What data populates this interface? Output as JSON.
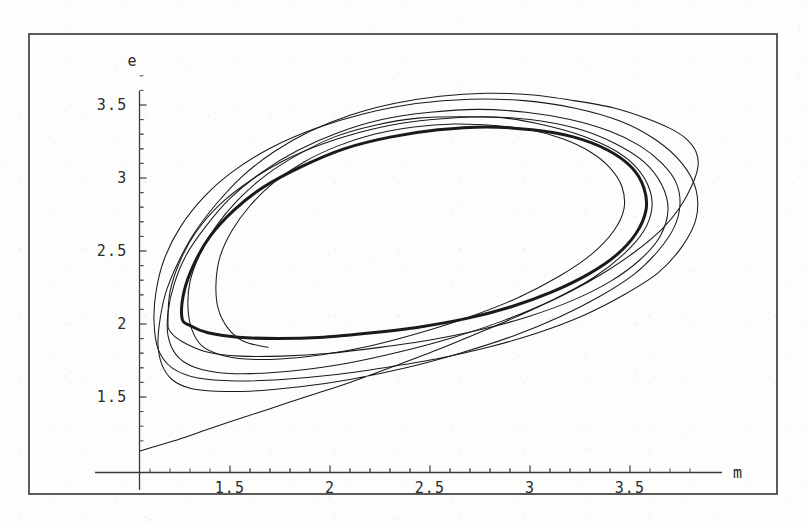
{
  "figure": {
    "background_color": "#fdfdfc",
    "frame_color": "#333333",
    "curve_color": "#1a1a1a",
    "axis_color": "#3a3a3a",
    "frame": {
      "x": 29,
      "y": 34,
      "width": 748,
      "height": 460
    }
  },
  "chart_data": {
    "type": "line",
    "title": "",
    "subtitle": "",
    "xlabel": "m",
    "ylabel": "e",
    "xlim": [
      1.045,
      3.88
    ],
    "ylim": [
      1.125,
      3.72
    ],
    "grid": false,
    "legend": "none",
    "axis_origin": {
      "x": 1.045,
      "y": 1.125
    },
    "x_ticks_major": [
      1.5,
      2,
      2.5,
      3,
      3.5
    ],
    "x_tick_labels": [
      "1.5",
      "2",
      "2.5",
      "3",
      "3.5"
    ],
    "x_minor_ticks_per_interval": 4,
    "y_ticks_major": [
      1.5,
      2,
      2.5,
      3,
      3.5
    ],
    "y_tick_labels": [
      "1.5",
      "2",
      "2.5",
      "3",
      "3.5"
    ],
    "y_minor_ticks_per_interval": 4,
    "series": [
      {
        "name": "transient-approach",
        "style": "thin",
        "points": [
          [
            1.05,
            1.13
          ],
          [
            1.12,
            1.16
          ],
          [
            1.22,
            1.2
          ],
          [
            1.35,
            1.26
          ],
          [
            1.5,
            1.33
          ],
          [
            1.7,
            1.42
          ],
          [
            1.9,
            1.51
          ],
          [
            2.1,
            1.6
          ],
          [
            2.32,
            1.71
          ],
          [
            2.55,
            1.83
          ],
          [
            2.78,
            1.96
          ],
          [
            3.0,
            2.09
          ],
          [
            3.2,
            2.22
          ],
          [
            3.38,
            2.36
          ],
          [
            3.53,
            2.5
          ],
          [
            3.66,
            2.65
          ],
          [
            3.75,
            2.8
          ],
          [
            3.81,
            2.95
          ],
          [
            3.84,
            3.08
          ],
          [
            3.83,
            3.18
          ],
          [
            3.78,
            3.27
          ],
          [
            3.7,
            3.34
          ],
          [
            3.58,
            3.41
          ],
          [
            3.42,
            3.48
          ],
          [
            3.22,
            3.53
          ],
          [
            3.0,
            3.57
          ],
          [
            2.78,
            3.58
          ],
          [
            2.55,
            3.56
          ],
          [
            2.32,
            3.51
          ],
          [
            2.1,
            3.43
          ],
          [
            1.9,
            3.32
          ],
          [
            1.72,
            3.18
          ],
          [
            1.56,
            3.01
          ],
          [
            1.43,
            2.82
          ],
          [
            1.32,
            2.62
          ],
          [
            1.24,
            2.42
          ],
          [
            1.18,
            2.22
          ],
          [
            1.15,
            2.03
          ],
          [
            1.14,
            1.86
          ],
          [
            1.16,
            1.72
          ],
          [
            1.21,
            1.62
          ],
          [
            1.3,
            1.56
          ],
          [
            1.43,
            1.54
          ],
          [
            1.6,
            1.54
          ],
          [
            1.85,
            1.57
          ],
          [
            2.1,
            1.62
          ],
          [
            2.38,
            1.7
          ],
          [
            2.65,
            1.8
          ],
          [
            2.92,
            1.92
          ],
          [
            3.15,
            2.05
          ],
          [
            3.35,
            2.19
          ],
          [
            3.52,
            2.34
          ],
          [
            3.64,
            2.5
          ],
          [
            3.72,
            2.66
          ],
          [
            3.75,
            2.82
          ],
          [
            3.73,
            2.97
          ],
          [
            3.66,
            3.1
          ],
          [
            3.55,
            3.22
          ],
          [
            3.4,
            3.32
          ],
          [
            3.2,
            3.4
          ],
          [
            2.98,
            3.45
          ],
          [
            2.74,
            3.47
          ],
          [
            2.5,
            3.45
          ],
          [
            2.26,
            3.4
          ],
          [
            2.04,
            3.31
          ],
          [
            1.84,
            3.19
          ],
          [
            1.66,
            3.04
          ],
          [
            1.5,
            2.86
          ],
          [
            1.38,
            2.67
          ],
          [
            1.28,
            2.47
          ],
          [
            1.22,
            2.27
          ],
          [
            1.19,
            2.08
          ],
          [
            1.19,
            1.92
          ],
          [
            1.23,
            1.79
          ],
          [
            1.31,
            1.71
          ],
          [
            1.43,
            1.67
          ],
          [
            1.6,
            1.66
          ],
          [
            1.82,
            1.68
          ],
          [
            2.08,
            1.73
          ],
          [
            2.35,
            1.81
          ],
          [
            2.62,
            1.91
          ],
          [
            2.88,
            2.03
          ],
          [
            3.12,
            2.17
          ],
          [
            3.32,
            2.32
          ],
          [
            3.47,
            2.48
          ],
          [
            3.57,
            2.64
          ],
          [
            3.61,
            2.8
          ],
          [
            3.59,
            2.95
          ],
          [
            3.52,
            3.09
          ],
          [
            3.41,
            3.2
          ],
          [
            3.26,
            3.29
          ],
          [
            3.08,
            3.36
          ],
          [
            2.88,
            3.41
          ],
          [
            2.66,
            3.42
          ],
          [
            2.44,
            3.41
          ],
          [
            2.22,
            3.36
          ],
          [
            2.02,
            3.28
          ],
          [
            1.84,
            3.16
          ],
          [
            1.68,
            3.02
          ],
          [
            1.54,
            2.85
          ],
          [
            1.43,
            2.67
          ],
          [
            1.35,
            2.48
          ],
          [
            1.3,
            2.29
          ],
          [
            1.29,
            2.11
          ],
          [
            1.31,
            1.96
          ],
          [
            1.36,
            1.85
          ],
          [
            1.45,
            1.79
          ],
          [
            1.58,
            1.76
          ],
          [
            1.75,
            1.76
          ],
          [
            1.96,
            1.79
          ],
          [
            2.2,
            1.85
          ],
          [
            2.45,
            1.94
          ],
          [
            2.7,
            2.05
          ],
          [
            2.94,
            2.18
          ],
          [
            3.15,
            2.33
          ],
          [
            3.31,
            2.48
          ],
          [
            3.42,
            2.64
          ],
          [
            3.47,
            2.79
          ],
          [
            3.46,
            2.94
          ],
          [
            3.4,
            3.07
          ],
          [
            3.3,
            3.18
          ],
          [
            3.16,
            3.27
          ],
          [
            3.0,
            3.33
          ],
          [
            2.82,
            3.36
          ],
          [
            2.62,
            3.37
          ],
          [
            2.42,
            3.35
          ],
          [
            2.22,
            3.3
          ],
          [
            2.04,
            3.22
          ],
          [
            1.87,
            3.11
          ],
          [
            1.72,
            2.97
          ],
          [
            1.6,
            2.81
          ],
          [
            1.51,
            2.64
          ],
          [
            1.45,
            2.46
          ],
          [
            1.43,
            2.28
          ],
          [
            1.44,
            2.11
          ],
          [
            1.49,
            1.97
          ],
          [
            1.57,
            1.88
          ],
          [
            1.69,
            1.84
          ]
        ]
      },
      {
        "name": "outer-loop",
        "style": "thin",
        "closed": true,
        "points": [
          [
            1.12,
            2.02
          ],
          [
            1.13,
            2.22
          ],
          [
            1.17,
            2.44
          ],
          [
            1.25,
            2.66
          ],
          [
            1.37,
            2.87
          ],
          [
            1.52,
            3.05
          ],
          [
            1.71,
            3.21
          ],
          [
            1.93,
            3.34
          ],
          [
            2.17,
            3.44
          ],
          [
            2.43,
            3.51
          ],
          [
            2.7,
            3.54
          ],
          [
            2.97,
            3.53
          ],
          [
            3.22,
            3.48
          ],
          [
            3.45,
            3.39
          ],
          [
            3.63,
            3.26
          ],
          [
            3.76,
            3.1
          ],
          [
            3.83,
            2.92
          ],
          [
            3.83,
            2.72
          ],
          [
            3.76,
            2.53
          ],
          [
            3.64,
            2.35
          ],
          [
            3.47,
            2.2
          ],
          [
            3.27,
            2.06
          ],
          [
            3.04,
            1.94
          ],
          [
            2.79,
            1.84
          ],
          [
            2.53,
            1.76
          ],
          [
            2.27,
            1.7
          ],
          [
            2.01,
            1.65
          ],
          [
            1.76,
            1.62
          ],
          [
            1.53,
            1.61
          ],
          [
            1.34,
            1.63
          ],
          [
            1.21,
            1.7
          ],
          [
            1.14,
            1.83
          ],
          [
            1.12,
            2.02
          ]
        ]
      },
      {
        "name": "middle-loop",
        "style": "thin",
        "closed": true,
        "points": [
          [
            1.19,
            2.02
          ],
          [
            1.2,
            2.22
          ],
          [
            1.25,
            2.43
          ],
          [
            1.33,
            2.63
          ],
          [
            1.45,
            2.82
          ],
          [
            1.61,
            2.99
          ],
          [
            1.8,
            3.14
          ],
          [
            2.02,
            3.26
          ],
          [
            2.26,
            3.35
          ],
          [
            2.51,
            3.4
          ],
          [
            2.76,
            3.42
          ],
          [
            3.0,
            3.4
          ],
          [
            3.23,
            3.34
          ],
          [
            3.42,
            3.24
          ],
          [
            3.57,
            3.11
          ],
          [
            3.66,
            2.95
          ],
          [
            3.69,
            2.78
          ],
          [
            3.65,
            2.6
          ],
          [
            3.55,
            2.44
          ],
          [
            3.4,
            2.29
          ],
          [
            3.21,
            2.16
          ],
          [
            2.99,
            2.05
          ],
          [
            2.75,
            1.96
          ],
          [
            2.5,
            1.89
          ],
          [
            2.25,
            1.84
          ],
          [
            2.0,
            1.8
          ],
          [
            1.76,
            1.78
          ],
          [
            1.55,
            1.78
          ],
          [
            1.38,
            1.81
          ],
          [
            1.26,
            1.88
          ],
          [
            1.2,
            1.95
          ],
          [
            1.19,
            2.02
          ]
        ]
      },
      {
        "name": "limit-cycle",
        "style": "thick",
        "closed": true,
        "points": [
          [
            1.26,
            2.04
          ],
          [
            1.27,
            2.22
          ],
          [
            1.32,
            2.41
          ],
          [
            1.4,
            2.6
          ],
          [
            1.52,
            2.78
          ],
          [
            1.67,
            2.94
          ],
          [
            1.86,
            3.08
          ],
          [
            2.07,
            3.2
          ],
          [
            2.3,
            3.28
          ],
          [
            2.54,
            3.33
          ],
          [
            2.78,
            3.35
          ],
          [
            3.01,
            3.33
          ],
          [
            3.22,
            3.28
          ],
          [
            3.39,
            3.19
          ],
          [
            3.51,
            3.07
          ],
          [
            3.57,
            2.93
          ],
          [
            3.58,
            2.78
          ],
          [
            3.53,
            2.62
          ],
          [
            3.43,
            2.47
          ],
          [
            3.29,
            2.34
          ],
          [
            3.11,
            2.22
          ],
          [
            2.91,
            2.12
          ],
          [
            2.69,
            2.04
          ],
          [
            2.45,
            1.98
          ],
          [
            2.21,
            1.94
          ],
          [
            1.97,
            1.91
          ],
          [
            1.74,
            1.9
          ],
          [
            1.54,
            1.91
          ],
          [
            1.39,
            1.94
          ],
          [
            1.3,
            1.99
          ],
          [
            1.26,
            2.04
          ]
        ]
      }
    ]
  },
  "labels": {
    "y_axis_name": "e",
    "x_axis_name": "m"
  }
}
